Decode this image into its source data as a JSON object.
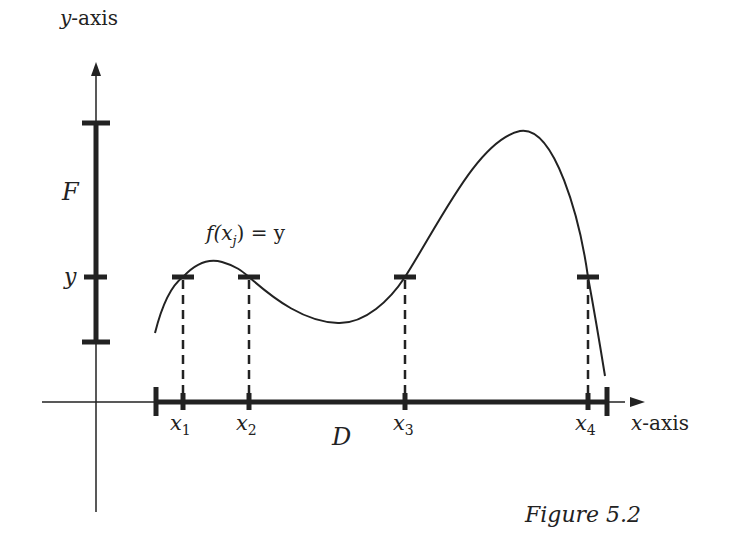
{
  "figure": {
    "caption": "Figure 5.2",
    "y_axis_label_var": "y",
    "y_axis_label_rest": "-axis",
    "x_axis_label_var": "x",
    "x_axis_label_rest": "-axis",
    "codomain_label": "F",
    "domain_label": "D",
    "level_label": "y",
    "equation": {
      "f": "f(x",
      "sub": "j",
      "rest": ") = y"
    },
    "points": [
      {
        "name": "x",
        "sub": "1"
      },
      {
        "name": "x",
        "sub": "2"
      },
      {
        "name": "x",
        "sub": "3"
      },
      {
        "name": "x",
        "sub": "4"
      }
    ],
    "colors": {
      "ink": "#222222",
      "background": "#ffffff"
    }
  }
}
